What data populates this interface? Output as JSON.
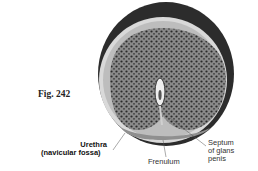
{
  "figure": {
    "label": "Fig. 242"
  },
  "labels": {
    "urethra_line1": "Urethra",
    "urethra_line2": "(navicular fossa)",
    "frenulum": "Frenulum",
    "septum_line1": "Septum",
    "septum_line2": "of glans",
    "septum_line3": "penis"
  }
}
